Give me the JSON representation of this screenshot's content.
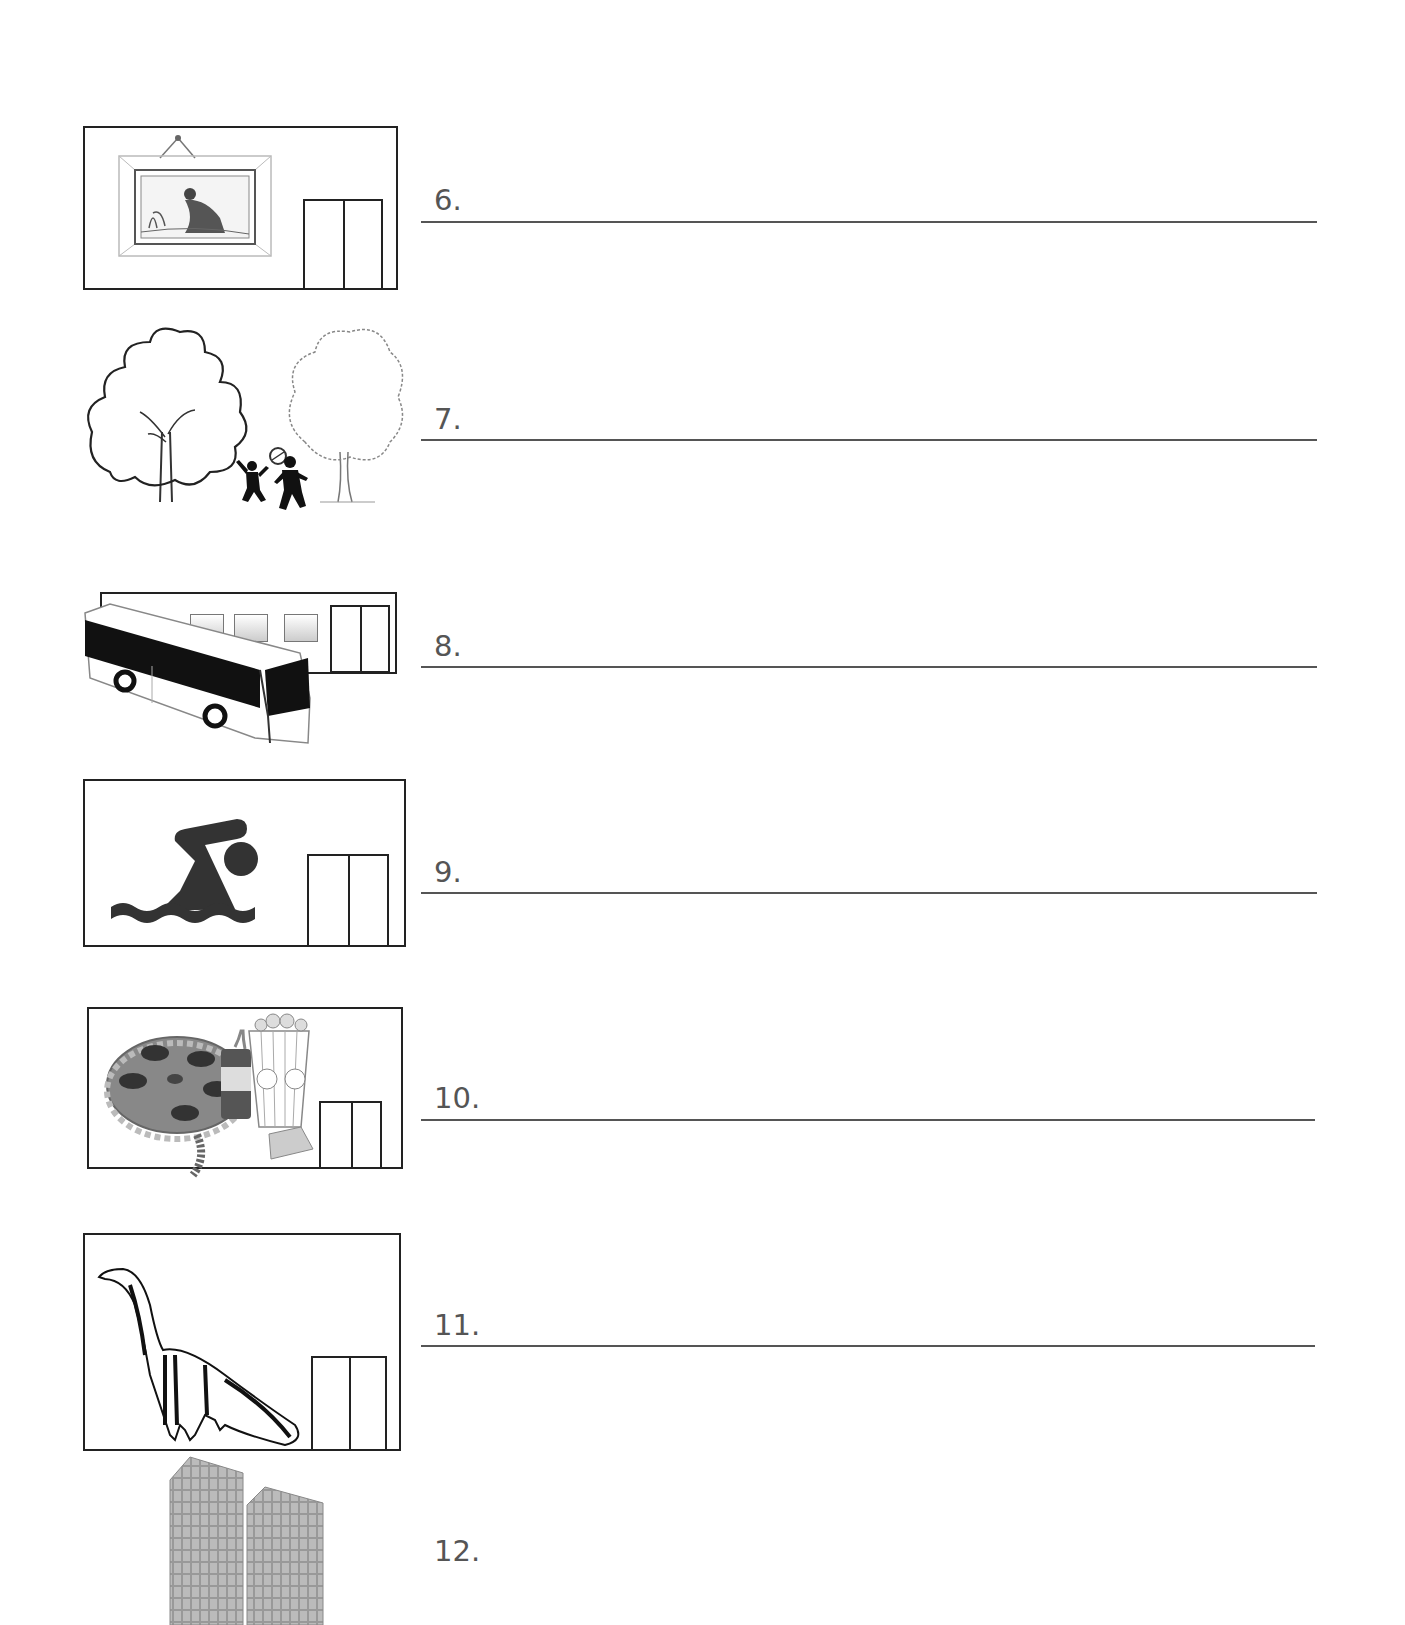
{
  "worksheet": {
    "items": [
      {
        "number": "6.",
        "picture": "art-gallery-museum-icon"
      },
      {
        "number": "7.",
        "picture": "park-icon"
      },
      {
        "number": "8.",
        "picture": "bus-station-icon"
      },
      {
        "number": "9.",
        "picture": "swimming-pool-icon"
      },
      {
        "number": "10.",
        "picture": "cinema-icon"
      },
      {
        "number": "11.",
        "picture": "natural-history-museum-icon"
      },
      {
        "number": "12.",
        "picture": "office-buildings-icon"
      }
    ]
  },
  "colors": {
    "text": "#555555",
    "line": "#555555",
    "outline": "#222222"
  }
}
